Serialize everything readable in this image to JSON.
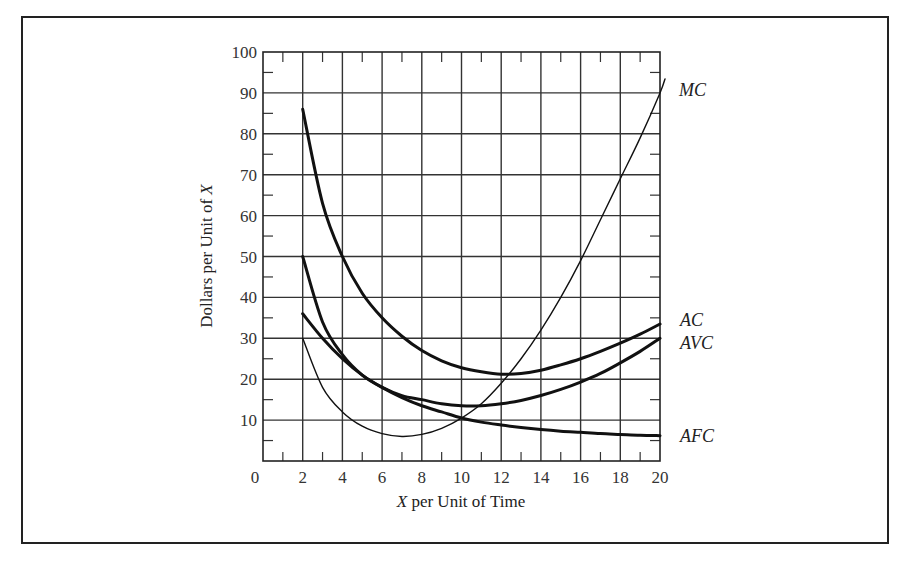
{
  "chart_data": {
    "type": "line",
    "title": "",
    "xlabel": "X per Unit of Time",
    "ylabel": "Dollars per Unit of X",
    "xlim": [
      0,
      20
    ],
    "ylim": [
      0,
      100
    ],
    "grid": true,
    "x_ticks": [
      0,
      2,
      4,
      6,
      8,
      10,
      12,
      14,
      16,
      18,
      20
    ],
    "y_ticks": [
      10,
      20,
      30,
      40,
      50,
      60,
      70,
      80,
      90,
      100
    ],
    "legend_position": "curve-end labels on right",
    "series": [
      {
        "name": "MC",
        "style": "thin",
        "x": [
          2,
          3,
          4,
          5,
          6,
          7,
          8,
          9,
          10,
          11,
          12,
          13,
          14,
          15,
          16,
          17,
          18,
          19,
          20
        ],
        "values": [
          30,
          18,
          12,
          8.5,
          6.7,
          6,
          6.5,
          8,
          10.5,
          14,
          19,
          25,
          32,
          40,
          49,
          59,
          69,
          79,
          90
        ]
      },
      {
        "name": "AC",
        "style": "thick",
        "x": [
          2,
          3,
          4,
          5,
          6,
          7,
          8,
          9,
          10,
          11,
          12,
          13,
          14,
          15,
          16,
          17,
          18,
          19,
          20
        ],
        "values": [
          86,
          63,
          50,
          41,
          35,
          30.5,
          27,
          24.5,
          22.8,
          21.8,
          21.2,
          21.4,
          22.2,
          23.5,
          25,
          26.8,
          28.8,
          31,
          33.5
        ]
      },
      {
        "name": "AVC",
        "style": "thick",
        "x": [
          2,
          3,
          4,
          5,
          6,
          7,
          8,
          9,
          10,
          11,
          12,
          13,
          14,
          15,
          16,
          17,
          18,
          19,
          20
        ],
        "values": [
          50,
          34,
          26,
          21,
          18,
          16,
          15,
          14,
          13.5,
          13.5,
          14,
          14.8,
          16,
          17.5,
          19.3,
          21.4,
          24,
          26.8,
          30
        ]
      },
      {
        "name": "AFC",
        "style": "thick",
        "x": [
          2,
          3,
          4,
          5,
          6,
          7,
          8,
          9,
          10,
          11,
          12,
          13,
          14,
          15,
          16,
          17,
          18,
          19,
          20
        ],
        "values": [
          36,
          30,
          25,
          21,
          18,
          15.5,
          13.5,
          12,
          10.5,
          9.5,
          8.8,
          8.2,
          7.7,
          7.3,
          7,
          6.7,
          6.5,
          6.3,
          6.2
        ]
      }
    ]
  },
  "labels": {
    "xlabel_prefix": "X",
    "xlabel_rest": " per Unit of Time",
    "ylabel_prefix": "Dollars per Unit of ",
    "ylabel_var": "X",
    "mc": "MC",
    "ac": "AC",
    "avc": "AVC",
    "afc": "AFC"
  }
}
